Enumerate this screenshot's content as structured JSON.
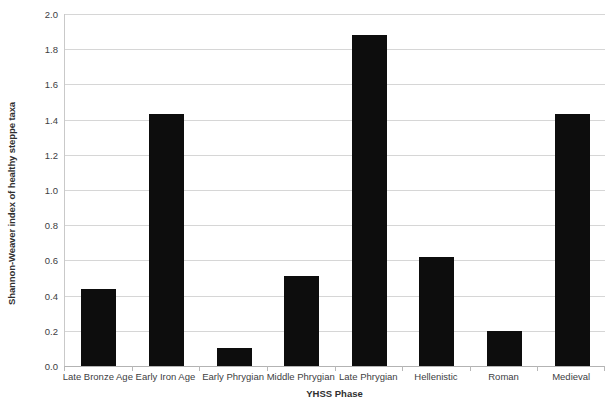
{
  "chart_data": {
    "type": "bar",
    "title": "",
    "xlabel": "YHSS Phase",
    "ylabel": "Shannon-Weaver index of healthy steppe taxa",
    "categories": [
      "Late Bronze Age",
      "Early Iron Age",
      "Early Phrygian",
      "Middle Phrygian",
      "Late Phrygian",
      "Hellenistic",
      "Roman",
      "Medieval"
    ],
    "values": [
      0.44,
      1.43,
      0.1,
      0.51,
      1.88,
      0.62,
      0.2,
      1.43
    ],
    "ylim": [
      0.0,
      2.0
    ],
    "ytick_values": [
      0.0,
      0.2,
      0.4,
      0.6,
      0.8,
      1.0,
      1.2,
      1.4,
      1.6,
      1.8,
      2.0
    ],
    "ytick_labels": [
      "0.0",
      "0.2",
      "0.4",
      "0.6",
      "0.8",
      "1.0",
      "1.2",
      "1.4",
      "1.6",
      "1.8",
      "2.0"
    ],
    "grid": true,
    "legend": false,
    "bar_color": "#0d0d0d",
    "gridline_color": "#d6d6d6",
    "axis_color": "#b3b3b3",
    "background_color": "#ffffff"
  }
}
